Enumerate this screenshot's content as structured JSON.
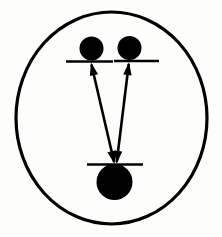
{
  "figure": {
    "title": "Energy level transition schematic",
    "background_color": "#fdfdfb",
    "ink_color": "#000000",
    "width": 222,
    "height": 237
  },
  "outer_boundary": {
    "name": "enclosing-circle",
    "shape": "ellipse",
    "center_x": 111.5,
    "center_y": 118,
    "radius_x": 95.5,
    "radius_y": 106,
    "stroke_width": 3.2,
    "fill": "none"
  },
  "nodes": [
    {
      "id": "upper-left",
      "label": "",
      "center_x": 91.5,
      "center_y": 48.5,
      "radius": 12.0,
      "fill": "#000000"
    },
    {
      "id": "upper-right",
      "label": "",
      "center_x": 129.5,
      "center_y": 48.0,
      "radius": 12.0,
      "fill": "#000000"
    },
    {
      "id": "lower-center",
      "label": "",
      "center_x": 114.5,
      "center_y": 182.0,
      "radius": 18.0,
      "fill": "#000000"
    }
  ],
  "levels": [
    {
      "id": "level-upper-left",
      "label": "",
      "x1": 66,
      "x2": 113,
      "y": 61.5,
      "stroke_width": 2.4
    },
    {
      "id": "level-upper-right",
      "label": "",
      "x1": 114,
      "x2": 159,
      "y": 61.0,
      "stroke_width": 2.4
    },
    {
      "id": "level-lower-center",
      "label": "",
      "x1": 87,
      "x2": 143,
      "y": 164.5,
      "stroke_width": 2.4
    }
  ],
  "transitions": [
    {
      "id": "transition-left",
      "label": "",
      "from_x": 114.5,
      "from_y": 164.0,
      "to_x": 91.0,
      "to_y": 62.5,
      "double_headed": true,
      "stroke_width": 2.6
    },
    {
      "id": "transition-right",
      "label": "",
      "from_x": 116.5,
      "from_y": 164.0,
      "to_x": 129.0,
      "to_y": 62.0,
      "double_headed": true,
      "stroke_width": 2.6
    }
  ],
  "arrowhead": {
    "length": 13,
    "half_width": 4.2
  }
}
